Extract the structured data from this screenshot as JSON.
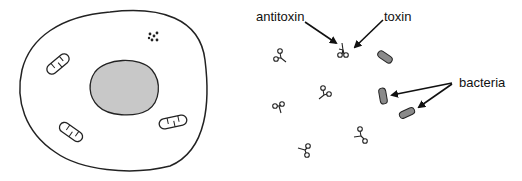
{
  "diagram": {
    "labels": {
      "antitoxin": "antitoxin",
      "toxin": "toxin",
      "bacteria": "bacteria"
    },
    "colors": {
      "stroke": "#222222",
      "nucleus_fill": "#c8c8c8",
      "bacteria_fill": "#8a8a8a",
      "background": "#ffffff"
    },
    "cell": {
      "organelles": [
        "nucleus",
        "mitochondrion",
        "mitochondrion",
        "mitochondrion",
        "granules"
      ]
    },
    "extracellular": {
      "antitoxin_toxin_complex_count": 1,
      "free_toxin_count": 5,
      "bacteria_count": 3
    }
  }
}
